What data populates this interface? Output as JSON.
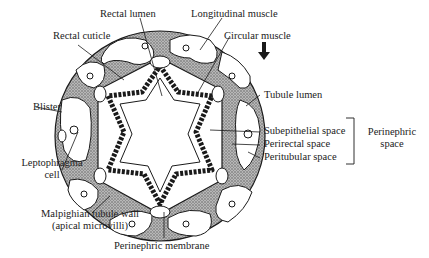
{
  "figure": {
    "labels": {
      "rectal_lumen": "Rectal lumen",
      "longitudinal_muscle": "Longitudinal muscle",
      "rectal_cuticle": "Rectal cuticle",
      "circular_muscle": "Circular muscle",
      "tubule_lumen": "Tubule lumen",
      "blister": "Blister",
      "subepithelial_space": "Subepithelial space",
      "perirectal_space": "Perirectal space",
      "peritubular_space": "Peritubular space",
      "perinephric_space_line1": "Perinephric",
      "perinephric_space_line2": "space",
      "leptophragma_line1": "Leptophragma",
      "leptophragma_line2": "cell",
      "malpighian_line1": "Malpighian tubule wall",
      "malpighian_line2": "(apical microvilli)",
      "perinephric_membrane": "Perinephric membrane"
    },
    "colors": {
      "outline": "#1a1a1a",
      "stipple": "#8a8a8a",
      "background": "#ffffff"
    }
  }
}
